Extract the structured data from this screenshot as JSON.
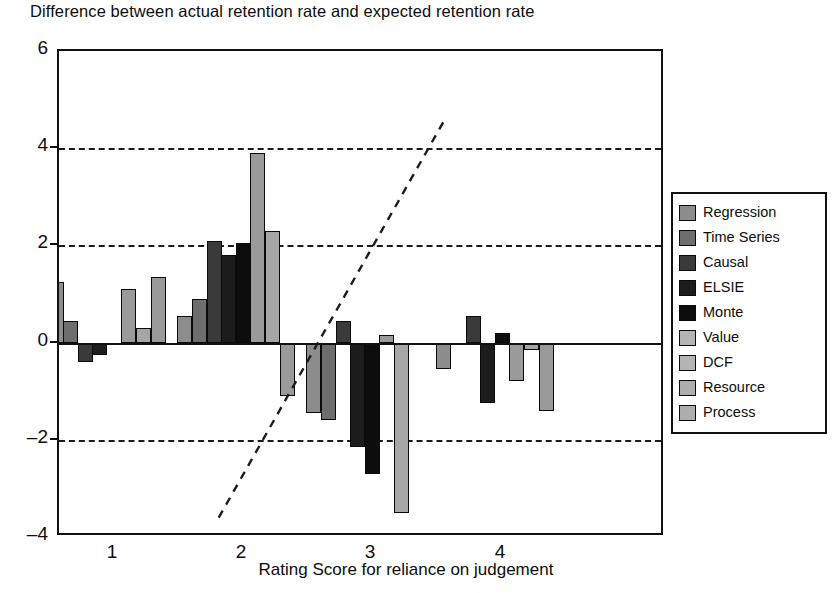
{
  "chart_data": {
    "type": "bar",
    "title": "Difference between actual retention rate and expected retention rate",
    "xlabel": "Rating Score for reliance on judgement",
    "ylabel": "",
    "categories": [
      "1",
      "2",
      "3",
      "4"
    ],
    "ylim": [
      -4,
      6
    ],
    "yticks": [
      6,
      4,
      2,
      0,
      -2,
      -4
    ],
    "grid": true,
    "gridlines_at": [
      4,
      2,
      -2
    ],
    "legend_position": "right",
    "series": [
      {
        "name": "Regression",
        "color": "#8d8d8d",
        "values": [
          1.25,
          0.55,
          -1.45,
          -0.55
        ]
      },
      {
        "name": "Time Series",
        "color": "#6e6e6e",
        "values": [
          0.45,
          0.9,
          -1.6,
          0.0
        ]
      },
      {
        "name": "Causal",
        "color": "#3a3a3a",
        "values": [
          -0.4,
          2.1,
          0.45,
          0.55
        ]
      },
      {
        "name": "ELSIE",
        "color": "#1c1c1c",
        "values": [
          -0.25,
          1.8,
          -2.15,
          -1.25
        ]
      },
      {
        "name": "Monte",
        "color": "#0d0d0d",
        "values": [
          0.0,
          2.05,
          -2.7,
          0.2
        ]
      },
      {
        "name": "Value",
        "color": "#9a9a9a",
        "values": [
          1.1,
          3.9,
          0.15,
          -0.8
        ]
      },
      {
        "name": "DCF",
        "color": "#a6a6a6",
        "values": [
          0.3,
          2.3,
          -3.5,
          -0.15
        ]
      },
      {
        "name": "Resource",
        "color": "#9a9a9a",
        "values": [
          1.35,
          -1.1,
          0.0,
          -1.4
        ]
      },
      {
        "name": "Process",
        "color": "#9a9a9a",
        "values": [
          0.0,
          0.0,
          0.0,
          0.0
        ]
      }
    ],
    "trend_line": {
      "style": "dashed",
      "color": "#1b1b1b",
      "start": {
        "x": 1.82,
        "y": -3.68
      },
      "end": {
        "x": 3.58,
        "y": 4.58
      }
    }
  },
  "legend": {
    "items": [
      {
        "label": "Regression",
        "swatch": "#8d8d8d"
      },
      {
        "label": "Time Series",
        "swatch": "#6e6e6e"
      },
      {
        "label": "Causal",
        "swatch": "#3a3a3a"
      },
      {
        "label": "ELSIE",
        "swatch": "#1c1c1c"
      },
      {
        "label": "Monte",
        "swatch": "#0d0d0d"
      },
      {
        "label": "Value",
        "swatch": "#b4b4b4"
      },
      {
        "label": "DCF",
        "swatch": "#b4b4b4"
      },
      {
        "label": "Resource",
        "swatch": "#aeaeae"
      },
      {
        "label": "Process",
        "swatch": "#aeaeae"
      }
    ]
  }
}
